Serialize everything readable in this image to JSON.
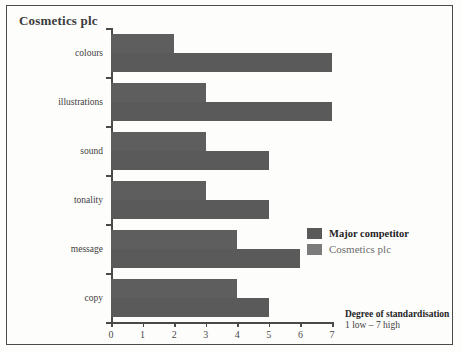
{
  "chart_data": {
    "type": "bar",
    "orientation": "horizontal",
    "title": "Cosmetics plc",
    "xlabel": "Degree of standardisation",
    "xlabel_sub": "1 low – 7 high",
    "ylabel": "",
    "xlim": [
      0,
      7
    ],
    "xticks": [
      "0",
      "1",
      "2",
      "3",
      "4",
      "5",
      "6",
      "7"
    ],
    "grid": false,
    "legend_position": "right",
    "categories": [
      "colours",
      "illustrations",
      "sound",
      "tonality",
      "message",
      "copy"
    ],
    "series": [
      {
        "name": "Cosmetics plc",
        "values": [
          2,
          3,
          3,
          3,
          4,
          4
        ],
        "color": "#5e5e5e"
      },
      {
        "name": "Major competitor",
        "values": [
          7,
          7,
          5,
          5,
          6,
          5
        ],
        "color": "#5a5a5a"
      }
    ]
  },
  "legend": {
    "entries": [
      {
        "label": "Major competitor",
        "swatch": "dark"
      },
      {
        "label": "Cosmetics plc",
        "swatch": "light"
      }
    ]
  }
}
